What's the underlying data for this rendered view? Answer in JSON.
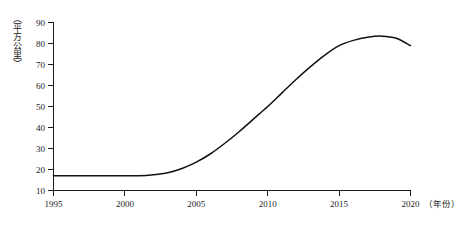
{
  "chart_data": {
    "type": "line",
    "title": "",
    "subtitle": "",
    "xlabel": "（年份）",
    "ylabel": "（平方公里）",
    "xlim": [
      1995,
      2020
    ],
    "ylim": [
      10,
      90
    ],
    "grid": false,
    "legend": false,
    "legend_position": "none",
    "x_ticks": [
      "1995",
      "2000",
      "2005",
      "2010",
      "2015",
      "2020"
    ],
    "x_tick_values": [
      1995,
      2000,
      2005,
      2010,
      2015,
      2020
    ],
    "y_ticks": [
      "10",
      "20",
      "30",
      "40",
      "50",
      "60",
      "70",
      "80",
      "90"
    ],
    "y_tick_values": [
      10,
      20,
      30,
      40,
      50,
      60,
      70,
      80,
      90
    ],
    "series": [
      {
        "name": "建成区面积",
        "color": "#111111",
        "x": [
          1995,
          1996,
          1997,
          1998,
          1999,
          2000,
          2001,
          2002,
          2003,
          2004,
          2005,
          2006,
          2007,
          2008,
          2009,
          2010,
          2011,
          2012,
          2013,
          2014,
          2015,
          2016,
          2017,
          2018,
          2019,
          2020
        ],
        "values": [
          17,
          17,
          17,
          17,
          17,
          17,
          17,
          17.5,
          18.5,
          20.5,
          23.5,
          27.5,
          32.5,
          38,
          44,
          50,
          56.5,
          63,
          69,
          74.5,
          79,
          81.5,
          83,
          83.5,
          82.5,
          79
        ]
      }
    ],
    "annotations": []
  },
  "axis": {
    "y_title": "（平方公里）",
    "x_title": "（年份）"
  }
}
